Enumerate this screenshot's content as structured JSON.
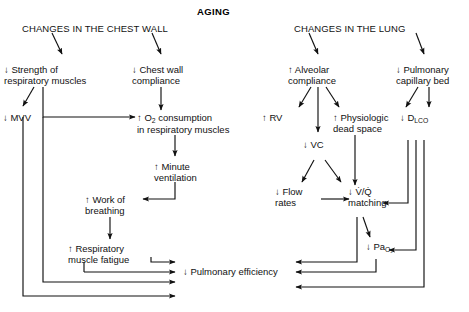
{
  "diagram": {
    "title": "AGING",
    "type": "flowchart",
    "headings": [
      {
        "id": "chest-wall",
        "label": "CHANGES IN THE CHEST WALL"
      },
      {
        "id": "lung",
        "label": "CHANGES IN THE LUNG"
      }
    ],
    "nodes": [
      {
        "id": "strength-respiratory-muscles",
        "line1": "↓ Strength of",
        "line2": "respiratory muscles",
        "direction": "down"
      },
      {
        "id": "chest-wall-compliance",
        "line1": "↓ Chest wall",
        "line2": "compliance",
        "direction": "down"
      },
      {
        "id": "alveolar-compliance",
        "line1": "↑ Alveolar",
        "line2": "compliance",
        "direction": "up"
      },
      {
        "id": "pulmonary-capillary-bed",
        "line1": "↓ Pulmonary",
        "line2": "capillary bed",
        "direction": "down"
      },
      {
        "id": "mvv",
        "line1": "↓ MVV",
        "line2": "",
        "direction": "down"
      },
      {
        "id": "o2-consumption",
        "line1": "↑ O",
        "sub1": "2",
        "line1b": " consumption",
        "line2": "in respiratory muscles",
        "direction": "up"
      },
      {
        "id": "minute-ventilation",
        "line1": "↑ Minute",
        "line2": "ventilation",
        "direction": "up"
      },
      {
        "id": "work-of-breathing",
        "line1": "↑ Work of",
        "line2": "breathing",
        "direction": "up"
      },
      {
        "id": "respiratory-muscle-fatigue",
        "line1": "↑ Respiratory",
        "line2": "muscle fatigue",
        "direction": "up"
      },
      {
        "id": "rv",
        "line1": "↑ RV",
        "line2": "",
        "direction": "up"
      },
      {
        "id": "physiologic-dead-space",
        "line1": "↑ Physiologic",
        "line2": "dead space",
        "direction": "up"
      },
      {
        "id": "dlco",
        "line1": "↓ D",
        "sub1": "LCO",
        "line2": "",
        "direction": "down"
      },
      {
        "id": "vc",
        "line1": "↓ VC",
        "line2": "",
        "direction": "down"
      },
      {
        "id": "flow-rates",
        "line1": "↓ Flow",
        "line2": "rates",
        "direction": "down"
      },
      {
        "id": "vq-matching",
        "line1": "↓ V/Q",
        "line2": "matching",
        "direction": "down"
      },
      {
        "id": "pao2",
        "line1": "↓ Pa",
        "sub1": "O2",
        "line2": "",
        "direction": "down"
      },
      {
        "id": "pulmonary-efficiency",
        "line1": "↓ Pulmonary efficiency",
        "line2": "",
        "direction": "down"
      }
    ],
    "labels": {
      "title": "AGING",
      "heading_chest_wall": "CHANGES IN THE CHEST WALL",
      "heading_lung": "CHANGES IN THE LUNG",
      "strength_l1": "↓ Strength of",
      "strength_l2": "respiratory muscles",
      "chestwallcompliance_l1": "↓ Chest wall",
      "chestwallcompliance_l2": "compliance",
      "alveolar_l1": "↑ Alveolar",
      "alveolar_l2": "compliance",
      "pulmcap_l1": "↓ Pulmonary",
      "pulmcap_l2": "capillary bed",
      "mvv": "↓ MVV",
      "o2_pre": "↑ O",
      "o2_sub": "2",
      "o2_post": " consumption",
      "o2_l2": "in respiratory muscles",
      "minvent_l1": "↑ Minute",
      "minvent_l2": "ventilation",
      "work_l1": "↑ Work of",
      "work_l2": "breathing",
      "fatigue_l1": "↑ Respiratory",
      "fatigue_l2": "muscle fatigue",
      "rv": "↑ RV",
      "physdead_l1": "↑ Physiologic",
      "physdead_l2": "dead space",
      "dlco_pre": "↓ D",
      "dlco_sub": "LCO",
      "vc": "↓ VC",
      "flow_l1": "↓ Flow",
      "flow_l2": "rates",
      "vq_l1": "↓ V̇/Q̇",
      "vq_l2": "matching",
      "pao2_pre": "↓ Pa",
      "pao2_sub": "O₂",
      "pulmeff": "↓ Pulmonary efficiency"
    },
    "colors": {
      "ink": "#111111",
      "background": "#ffffff"
    }
  }
}
